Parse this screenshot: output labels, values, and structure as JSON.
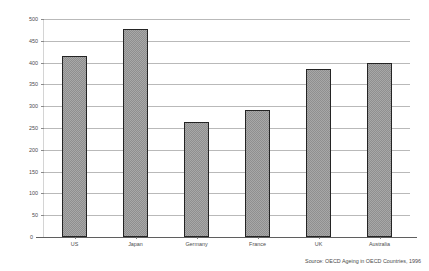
{
  "chart_data": {
    "type": "bar",
    "title": "",
    "subtitle": "",
    "xlabel": "",
    "ylabel": "",
    "categories": [
      "US",
      "Japan",
      "Germany",
      "France",
      "UK",
      "Australia"
    ],
    "values": [
      415,
      478,
      263,
      291,
      385,
      400
    ],
    "ylim": [
      0,
      500
    ],
    "ytick_labels": [
      "0",
      "50",
      "100",
      "150",
      "200",
      "250",
      "300",
      "350",
      "400",
      "450",
      "500"
    ],
    "ytick_values": [
      0,
      50,
      100,
      150,
      200,
      250,
      300,
      350,
      400,
      450,
      500
    ],
    "grid": true,
    "legend": false,
    "legend_position": "none",
    "series": [
      {
        "name": "",
        "values": [
          415,
          478,
          263,
          291,
          385,
          400
        ],
        "fill_color": "#a8a8a8",
        "edge_color": "#242424"
      }
    ]
  },
  "footer": {
    "source_note": "Source: OECD Ageing in OECD Countries, 1996"
  }
}
